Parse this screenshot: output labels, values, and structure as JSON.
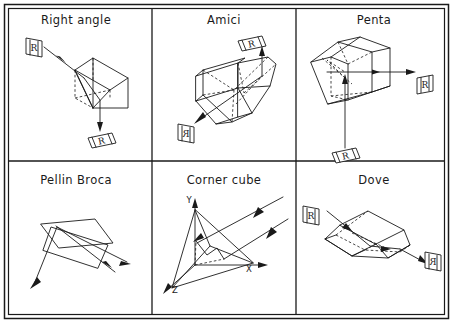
{
  "figure": {
    "name": "prism-types-diagram",
    "width": 453,
    "height": 323,
    "background_color": "#ffffff",
    "line_color": "#1a1a1a",
    "grid": {
      "rows": 2,
      "columns": 3,
      "column_dividers_x": [
        152,
        296
      ],
      "row_divider_y": 161
    }
  },
  "cells": [
    {
      "id": "right-angle",
      "title": "Right angle",
      "title_x": 76,
      "title_y": 24,
      "input_label": {
        "text": "R",
        "x": 33,
        "y": 48,
        "orientation": "upright-vertical-plate"
      },
      "output_label": {
        "text": "R",
        "x": 100,
        "y": 140,
        "orientation": "rotated-horizontal-plate"
      },
      "ray_description": "ray enters upper-left face, reflects once, exits downward"
    },
    {
      "id": "amici",
      "title": "Amici",
      "title_x": 224,
      "title_y": 24,
      "input_label": {
        "text": "R",
        "x": 185,
        "y": 132,
        "orientation": "mirrored-vertical-plate"
      },
      "output_label": {
        "text": "R",
        "x": 250,
        "y": 42,
        "orientation": "rotated-horizontal-plate"
      },
      "ray_description": "ray enters from lower-left, roof reflection, exits upward"
    },
    {
      "id": "penta",
      "title": "Penta",
      "title_x": 374,
      "title_y": 24,
      "input_label": {
        "text": "R",
        "x": 345,
        "y": 158,
        "orientation": "rotated-horizontal-plate"
      },
      "output_label": {
        "text": "R",
        "x": 424,
        "y": 86,
        "orientation": "upright-vertical-plate"
      },
      "ray_description": "ray enters from below, two reflections, exits right at 90 degrees"
    },
    {
      "id": "pellin-broca",
      "title": "Pellin Broca",
      "title_x": 76,
      "title_y": 184,
      "input_label": null,
      "output_label": null,
      "ray_description": "ray enters lower-left, internal reflection, exits lower-right; two ray paths shown"
    },
    {
      "id": "corner-cube",
      "title": "Corner cube",
      "title_x": 224,
      "title_y": 184,
      "input_label": null,
      "output_label": null,
      "axes": [
        {
          "label": "Y",
          "x": 193,
          "y": 202
        },
        {
          "label": "X",
          "x": 249,
          "y": 270
        },
        {
          "label": "Z",
          "x": 172,
          "y": 290
        }
      ],
      "ray_description": "retroreflector: incoming and outgoing parallel rays to upper right"
    },
    {
      "id": "dove",
      "title": "Dove",
      "title_x": 374,
      "title_y": 184,
      "input_label": {
        "text": "R",
        "x": 311,
        "y": 216,
        "orientation": "upright-vertical-plate"
      },
      "output_label": {
        "text": "R",
        "x": 433,
        "y": 262,
        "orientation": "mirrored-vertical-plate"
      },
      "ray_description": "ray enters left entrance face, reflects off base, exits right inverted"
    }
  ]
}
